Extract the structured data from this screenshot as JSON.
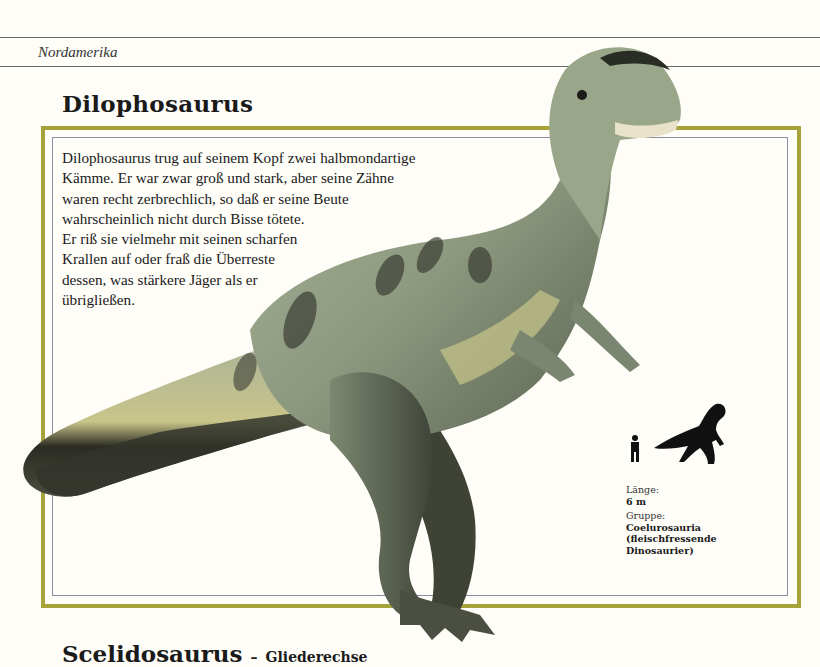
{
  "header": {
    "region": "Nordamerika"
  },
  "entry": {
    "title": "Dilophosaurus",
    "description_lines": [
      "Dilophosaurus trug auf seinem Kopf zwei halbmondartige",
      "Kämme. Er war zwar groß und stark, aber seine Zähne",
      "waren recht zerbrechlich, so daß er seine Beute",
      "wahrscheinlich nicht durch Bisse tötete.",
      "Er riß sie vielmehr mit seinen scharfen",
      "Krallen auf oder fraß die Überreste",
      "dessen, was stärkere Jäger als er",
      "übrigließen."
    ],
    "facts": {
      "length_label": "Länge:",
      "length_value": "6 m",
      "group_label": "Gruppe:",
      "group_value_lines": [
        "Coelurosauria",
        "(fleischfressende",
        "Dinosaurier)"
      ]
    },
    "illustration": "dilophosaurus-illustration",
    "size_comparison": [
      "human-silhouette-icon",
      "dinosaur-silhouette-icon"
    ]
  },
  "next_entry": {
    "title": "Scelidosaurus",
    "separator": "–",
    "subtitle": "Gliederechse"
  },
  "colors": {
    "frame_olive": "#a5a33a",
    "inner_line": "#8a8aa0",
    "paper": "#fefdf8",
    "dino_green": "#8e9a7e"
  }
}
